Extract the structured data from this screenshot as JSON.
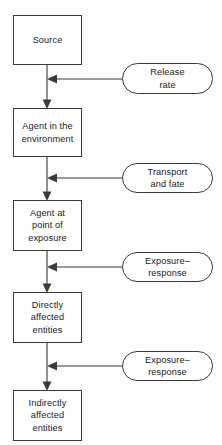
{
  "diagram": {
    "background_color": "#fdfdfc",
    "stroke_color": "#3a3a3a",
    "text_color": "#1a1a1a",
    "stages": [
      {
        "id": "source",
        "label": "Source",
        "shape": "rectangle",
        "x": 13,
        "y": 15,
        "w": 69,
        "h": 50
      },
      {
        "id": "agent-in-environment",
        "label": "Agent in the\nenvironment",
        "shape": "rectangle",
        "x": 13,
        "y": 108,
        "w": 69,
        "h": 49
      },
      {
        "id": "agent-at-point-of-exposure",
        "label": "Agent at\npoint of\nexposure",
        "shape": "rectangle",
        "x": 13,
        "y": 200,
        "w": 69,
        "h": 51
      },
      {
        "id": "directly-affected-entities",
        "label": "Directly\naffected\nentities",
        "shape": "rectangle",
        "x": 13,
        "y": 292,
        "w": 69,
        "h": 51
      },
      {
        "id": "indirectly-affected-entities",
        "label": "Indirectly\naffected\nentities",
        "shape": "rectangle",
        "x": 13,
        "y": 390,
        "w": 69,
        "h": 51
      }
    ],
    "modifiers": [
      {
        "id": "release-rate",
        "label": "Release\nrate",
        "shape": "rounded",
        "x": 122,
        "y": 63,
        "w": 91,
        "h": 31
      },
      {
        "id": "transport-and-fate",
        "label": "Transport\nand fate",
        "shape": "rounded",
        "x": 122,
        "y": 163,
        "w": 91,
        "h": 30
      },
      {
        "id": "exposure-response-direct",
        "label": "Exposure–\nresponse",
        "shape": "rounded",
        "x": 122,
        "y": 252,
        "w": 91,
        "h": 30
      },
      {
        "id": "exposure-response-indirect",
        "label": "Exposure–\nresponse",
        "shape": "rounded",
        "x": 122,
        "y": 351,
        "w": 91,
        "h": 30
      }
    ],
    "flow_arrows": [
      {
        "id": "source-to-agent-in-environment",
        "from": "source",
        "to": "agent-in-environment",
        "x": 47,
        "y1": 65,
        "y2": 108
      },
      {
        "id": "agent-in-environment-to-point-of-exposure",
        "from": "agent-in-environment",
        "to": "agent-at-point-of-exposure",
        "x": 47,
        "y1": 157,
        "y2": 200
      },
      {
        "id": "point-of-exposure-to-directly-affected",
        "from": "agent-at-point-of-exposure",
        "to": "directly-affected-entities",
        "x": 47,
        "y1": 251,
        "y2": 292
      },
      {
        "id": "directly-affected-to-indirectly-affected",
        "from": "directly-affected-entities",
        "to": "indirectly-affected-entities",
        "x": 47,
        "y1": 343,
        "y2": 390
      }
    ],
    "modifier_arrows": [
      {
        "id": "release-rate-arrow",
        "from": "release-rate",
        "x1": 122,
        "x2": 47,
        "y": 79
      },
      {
        "id": "transport-and-fate-arrow",
        "from": "transport-and-fate",
        "x1": 122,
        "x2": 47,
        "y": 178
      },
      {
        "id": "exposure-response-direct-arrow",
        "from": "exposure-response-direct",
        "x1": 122,
        "x2": 47,
        "y": 267
      },
      {
        "id": "exposure-response-indirect-arrow",
        "from": "exposure-response-indirect",
        "x1": 122,
        "x2": 47,
        "y": 366
      }
    ]
  }
}
